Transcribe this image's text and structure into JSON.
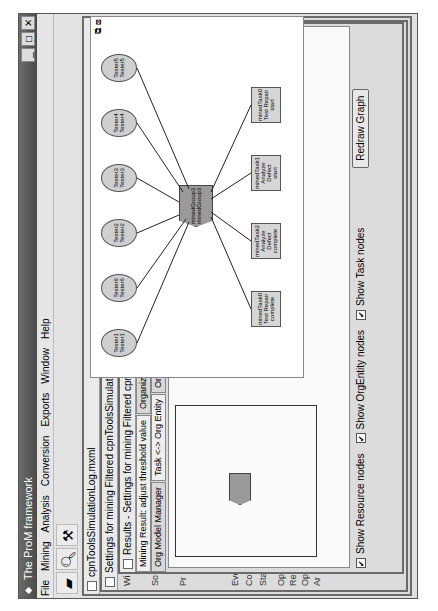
{
  "window": {
    "title": "The ProM framework",
    "controls": {
      "minimize": "_",
      "maximize": "□",
      "close": "✕"
    }
  },
  "menu": [
    "File",
    "Mining",
    "Analysis",
    "Conversion",
    "Exports",
    "Window",
    "Help"
  ],
  "toolbar": {
    "icons": [
      "open-folder-icon",
      "search-icon",
      "mining-icon"
    ]
  },
  "frames": {
    "log": {
      "title": "cpnToolsSimulationLog.mxml"
    },
    "settings": {
      "title": "Settings for mining Filtered cpnToolsSimulationLog.mxml",
      "side_labels": [
        "Wi",
        "So",
        "Pr",
        "Eve",
        "Com",
        "Sta",
        "Opt",
        "Re",
        "Opt",
        "Ar"
      ]
    },
    "results": {
      "title": "Results - Settings for mining Filtered cpnToolsSimulationLog.mxml",
      "tabs_row1": [
        "Mining Result: adjust threshold value",
        "Organiz"
      ],
      "tabs_row2": [
        "Org Model Manager",
        "Task <-> Org Entity",
        "Or"
      ]
    }
  },
  "zoomed_graph": {
    "center": {
      "line1": "minedGroup3",
      "line2": "minedGroup3"
    },
    "resources": [
      {
        "l1": "Tester1",
        "l2": "Tester1"
      },
      {
        "l1": "Tester6",
        "l2": "Tester6"
      },
      {
        "l1": "Tester2",
        "l2": "Tester2"
      },
      {
        "l1": "Tester3",
        "l2": "Tester3"
      },
      {
        "l1": "Tester4",
        "l2": "Tester4"
      },
      {
        "l1": "Tester5",
        "l2": "Tester5"
      }
    ],
    "tasks": [
      {
        "l1": "minedTask0",
        "l2": "Test Repair",
        "l3": "complete"
      },
      {
        "l1": "minedTask2",
        "l2": "Analyze Defect",
        "l3": "complete"
      },
      {
        "l1": "minedTask1",
        "l2": "Analyze Defect",
        "l3": "start"
      },
      {
        "l1": "minedTask0",
        "l2": "Test Repair",
        "l3": "start"
      }
    ]
  },
  "options": {
    "show_resource_nodes": {
      "label": "Show Resource nodes",
      "checked": true
    },
    "show_orgentity_nodes": {
      "label": "Show OrgEntity nodes",
      "checked": true
    },
    "show_task_nodes": {
      "label": "Show Task nodes",
      "checked": true
    },
    "redraw_button": "Redraw Graph",
    "zoom_label": "Zoom: 50 %"
  }
}
